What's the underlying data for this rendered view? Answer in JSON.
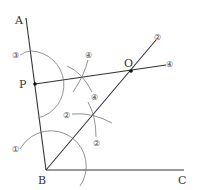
{
  "diagram": {
    "title": "",
    "points": {
      "A": {
        "label": "A",
        "x": 26,
        "y": 18
      },
      "B": {
        "label": "B",
        "x": 46,
        "y": 170
      },
      "C": {
        "label": "C",
        "x": 184,
        "y": 170
      },
      "P": {
        "label": "P",
        "x": 35,
        "y": 84
      },
      "O": {
        "label": "O",
        "x": 131,
        "y": 71
      }
    },
    "step_labels": {
      "s1": "①",
      "s2a": "②",
      "s2b": "②",
      "s2c": "②",
      "s3": "③",
      "s4a": "④",
      "s4b": "④",
      "s4c": "④"
    },
    "colors": {
      "line": "#333333",
      "arc": "#777777",
      "text": "#333333"
    }
  }
}
